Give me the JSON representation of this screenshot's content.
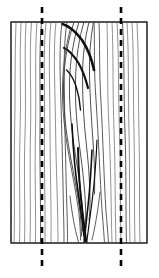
{
  "figure": {
    "canvas": {
      "width": 159,
      "height": 278,
      "background": "#ffffff"
    },
    "colors": {
      "outline": "#1a1a1a",
      "grain_light": "#6e6e6e",
      "grain_mid": "#4a4a4a",
      "grain_dark": "#111111",
      "cut_line": "#000000",
      "board_fill": "#ffffff"
    },
    "board": {
      "label": "wood board",
      "x": 11,
      "y": 22,
      "width": 136,
      "height": 221,
      "stroke_width": 1
    },
    "cut_lines": [
      {
        "label": "left cut line",
        "x": 42,
        "y_top": 7,
        "y_bottom": 268,
        "stroke_width": 2.6,
        "dash": "6 5"
      },
      {
        "label": "right cut line",
        "x": 121,
        "y_top": 7,
        "y_bottom": 268,
        "stroke_width": 2.6,
        "dash": "6 5"
      }
    ],
    "grain": {
      "description": "Near-vertical curved grain lines with a central knot of nested concentric arcs forming a teardrop that closes into a V near the bottom.",
      "light_lines": [
        "M16,22 C14.5,60 15.5,100 14.5,140 C13.8,178 15,212 14,243",
        "M21,22 C19,58 21.5,96 20,136 C18.8,176 20.5,210 19.5,243",
        "M26,22 C24,56 26.5,94 25,134 C23.6,174 25.5,210 24.5,243",
        "M31.5,22 C29,56 31.5,92 30.5,132 C29.5,172 31,210 30,243",
        "M37,22 C34.5,54 36.5,90 35.5,130 C34.5,172 36,210 35.5,243",
        "M46,22 C43,52 45,88 44.5,128 C44,170 45.5,208 45,243",
        "M51,22 C48,50 50,86 50,126 C50,168 51.5,208 51,243",
        "M56,22 C53,48 55,84 55.5,124 C56,168 58,208 58,243",
        "M137,22 C139,58 138,96 139,136 C140,176 139,212 140,243",
        "M132,22 C134,56 133,94 134,134 C135,176 134,212 135,243",
        "M127,22 C129,54 128,92 129,132 C130,174 129,212 130,243",
        "M117,22 C119,54 118,92 119.5,132 C121,174 120,212 121,243",
        "M112,22 C113.5,52 112.5,90 114,130 C115.5,172 115,212 116,243",
        "M107,22 C108,50 107,88 109,128 C111,170 111,210 112,243"
      ],
      "mid_lines": [
        "M99,22 C100,44 99,70 101,102 C103,140 104,180 106,212 C107.5,228 108,236 108.5,243",
        "M94,22 C95,42 93.5,66 96,100 C98.5,138 100,178 102,210 C103.5,227 104,236 104.5,243",
        "M62,22 C59,46 60,74 61,104 C62,140 63,180 63.5,212 C64,228 64,236 64,243",
        "M67,22 C63.5,44 64,70 64.5,100 C65,138 66,178 67,212 C67.5,228 67.5,236 67.5,243",
        "M41.5,22 C38.8,52 40.5,88 40,128 C39.6,170 41,208 40.5,243",
        "M122.5,22 C124.5,54 123.5,92 125,132 C126.5,174 125.5,212 126.5,243"
      ],
      "knot_arcs": [
        "M74,22 C68,40 64,62 63.5,84 C63,108 66,132 70,154 C74,176 78,196 80,212 C81,222 81.5,230 81.5,236",
        "M79,22 C73.5,40 70,60 69.5,82 C69,106 71.5,130 75,152 C78.5,174 81.5,194 82.5,210 C83,220 83,226 82.5,231",
        "M84,22 C79,38 76,58 75.5,80 C75,104 77,128 80,150 C83,172 85,192 85.5,206 C86,216 85.5,222 85,226",
        "M89,22 C85,38 82.5,56 82.5,78 C82.5,100 84,124 86.5,146 C89,168 90,188 90,202 C90,210 89.5,216 89,220",
        "M93.5,22 C90.5,38 89,56 89.5,76 C90,98 91.5,120 93,142 C94.5,162 95,180 94.5,194",
        "M70,30 C66,46 63,64 62.5,86 C62,110 65,134 69,156 C73,178 77,198 79,214 C80,224 80.5,232 80.5,240"
      ],
      "dark_strokes": [
        "M62.5,24 C69,26 76,32 82,40 C88,49 92,60 94,70",
        "M64,48 C69,50 74,56 78.5,63 C83,71 86,80 88,88",
        "M66.5,70 C70,73 73.5,79 76,86 C78.5,94 80,102 80.5,110",
        "M72,124 C73,150 75.5,176 79,198 C81,212 83,226 84,236 L85,243",
        "M78,148 C78.5,170 80,192 82,208 C83.5,220 85,232 86,240 L86.5,243",
        "M92,150 C91,172 89.5,192 88,206 C86.5,220 85,232 84.5,240 L84,243",
        "M97,140 C96,164 94,186 92,202 C90,218 88,232 87,240 L86.5,243"
      ],
      "bottom_v_lines": [
        "M70,196 C72,214 75,230 78,240 C79.5,246 80,250 80,250",
        "M100,192 C98,210 95,228 92,240"
      ]
    }
  }
}
